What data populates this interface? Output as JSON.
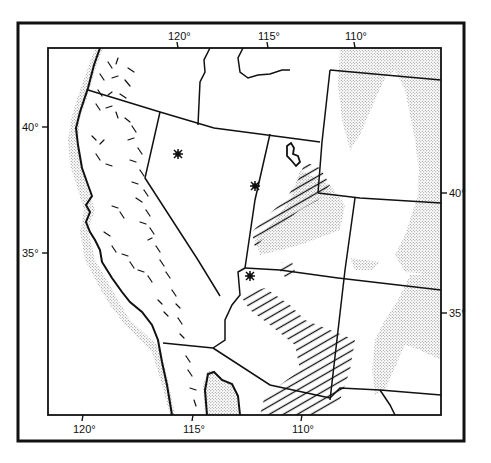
{
  "map": {
    "title": "",
    "region": "Western United States",
    "colors": {
      "ink": "#111111",
      "background": "#ffffff",
      "stipple": "#9a9a9a"
    },
    "longitude_ticks_top": [
      {
        "label": "120°",
        "x": 178
      },
      {
        "label": "115°",
        "x": 268
      },
      {
        "label": "110°",
        "x": 355
      }
    ],
    "longitude_ticks_bottom": [
      {
        "label": "120°",
        "x": 83
      },
      {
        "label": "115°",
        "x": 193
      },
      {
        "label": "110°",
        "x": 302
      }
    ],
    "latitude_ticks_left": [
      {
        "label": "40°",
        "y": 127
      },
      {
        "label": "35°",
        "y": 253
      }
    ],
    "latitude_ticks_right": [
      {
        "label": "40°",
        "y": 193
      },
      {
        "label": "35°",
        "y": 313
      }
    ],
    "markers": [
      {
        "symbol": "star",
        "x": 178,
        "y": 154
      },
      {
        "symbol": "star",
        "x": 255,
        "y": 186
      },
      {
        "symbol": "star",
        "x": 250,
        "y": 276
      }
    ],
    "legend_patterns": [
      {
        "pattern": "dashes",
        "area": "California Coast Ranges and Sierra Nevada"
      },
      {
        "pattern": "stipple",
        "area": "Coastal margin, Baja California, Wyoming basins, Colorado Plateau/Rockies"
      },
      {
        "pattern": "hatch",
        "area": "Utah and Arizona belt"
      }
    ]
  }
}
